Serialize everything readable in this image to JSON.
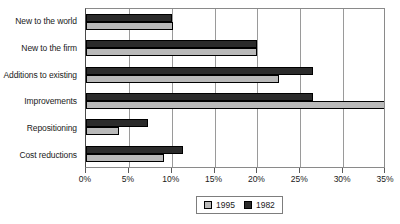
{
  "chart_data": {
    "type": "bar",
    "orientation": "horizontal",
    "title": "",
    "xlabel": "",
    "ylabel": "",
    "xlim": [
      0,
      35
    ],
    "xticks": [
      0,
      5,
      10,
      15,
      20,
      25,
      30,
      35
    ],
    "xtick_labels": [
      "0%",
      "5%",
      "10%",
      "15%",
      "20%",
      "25%",
      "30%",
      "35%"
    ],
    "grid": true,
    "grid_axis": "x",
    "legend_position": "bottom",
    "categories": [
      "New to the world",
      "New to the firm",
      "Additions to existing",
      "Improvements",
      "Repositioning",
      "Cost reductions"
    ],
    "series": [
      {
        "name": "1982",
        "color": "#2b2b2b",
        "values": [
          10.0,
          20.0,
          26.5,
          26.5,
          7.2,
          11.3
        ]
      },
      {
        "name": "1995",
        "color": "#b9b9b9",
        "values": [
          10.2,
          20.0,
          22.5,
          35.0,
          3.9,
          9.1
        ]
      }
    ]
  },
  "legend": {
    "entries": [
      {
        "label": "1995",
        "swatch": "light-gray-swatch"
      },
      {
        "label": "1982",
        "swatch": "dark-gray-swatch"
      }
    ]
  }
}
